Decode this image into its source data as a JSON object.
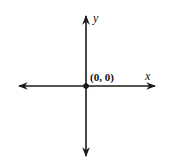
{
  "diagram": {
    "type": "cartesian-axes",
    "origin_label": "(0, 0)",
    "x_axis_label": "x",
    "y_axis_label": "y",
    "colors": {
      "line": "#1a1a1a",
      "background": "#ffffff"
    }
  }
}
